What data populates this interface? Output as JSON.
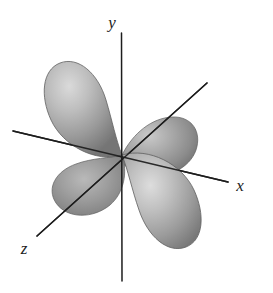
{
  "figure": {
    "kind": "atomic-orbital-illustration",
    "background_color": "#ffffff",
    "axis_color": "#1d1d1d",
    "lobe_count": 4
  },
  "axes": [
    {
      "id": "y",
      "label": "y",
      "orientation": "vertical",
      "label_x": 118,
      "label_y": 28,
      "x1": 121,
      "y1": 33,
      "x2": 122,
      "y2": 281
    },
    {
      "id": "x",
      "label": "x",
      "orientation": "horizontal-right-descending",
      "label_x": 234,
      "label_y": 190,
      "x1": 13,
      "y1": 131,
      "x2": 228,
      "y2": 182
    },
    {
      "id": "z",
      "label": "z",
      "orientation": "diagonal-lower-left-to-upper-right",
      "label_x": 22,
      "label_y": 252,
      "x1": 37,
      "y1": 236,
      "x2": 207,
      "y2": 83
    }
  ],
  "origin": {
    "x": 122,
    "y": 155
  },
  "lobes": [
    {
      "name": "upper-left-lobe",
      "cx": 81,
      "cy": 104,
      "rx": 33,
      "ry": 53,
      "rotation": -28,
      "fill_light": "#cfcfcf",
      "fill_mid": "#a3a3a3",
      "fill_dark": "#787878",
      "highlight_x": "32%",
      "highlight_y": "28%"
    },
    {
      "name": "upper-right-lobe",
      "cx": 166,
      "cy": 117,
      "rx": 30,
      "ry": 45,
      "rotation": 56,
      "fill_light": "#c2c2c2",
      "fill_mid": "#969696",
      "fill_dark": "#6e6e6e",
      "highlight_x": "34%",
      "highlight_y": "34%"
    },
    {
      "name": "lower-left-lobe",
      "cx": 78,
      "cy": 193,
      "rx": 30,
      "ry": 45,
      "rotation": 56,
      "fill_light": "#b4b4b4",
      "fill_mid": "#8c8c8c",
      "fill_dark": "#6a6a6a",
      "highlight_x": "40%",
      "highlight_y": "40%"
    },
    {
      "name": "lower-right-lobe",
      "cx": 163,
      "cy": 206,
      "rx": 33,
      "ry": 53,
      "rotation": -28,
      "fill_light": "#d2d2d2",
      "fill_mid": "#a6a6a6",
      "fill_dark": "#7b7b7b",
      "highlight_x": "34%",
      "highlight_y": "34%"
    }
  ]
}
